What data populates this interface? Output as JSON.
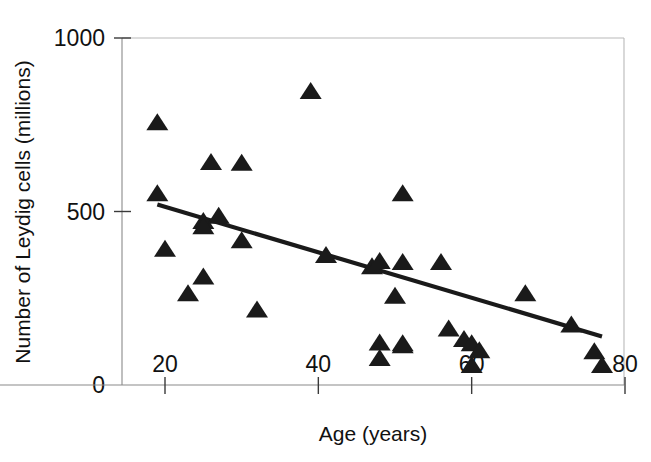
{
  "chart_data": {
    "type": "scatter",
    "title": "",
    "subtitle": "",
    "xlabel": "Age (years)",
    "ylabel": "Number of Leydig cells (millions)",
    "xlim": [
      17,
      80
    ],
    "ylim": [
      -110,
      1000
    ],
    "xticks": [
      20,
      40,
      60,
      80
    ],
    "xtick_labels": [
      "20",
      "40",
      "60",
      "80"
    ],
    "yticks": [
      0,
      500,
      1000
    ],
    "ytick_labels": [
      "0",
      "500",
      "1000"
    ],
    "grid": false,
    "legend": null,
    "legend_position": "none",
    "marker": "triangle",
    "marker_color": "#1a1a1a",
    "frame_color": "#b9b9b9",
    "axis_color": "#8a8a8a",
    "points": [
      {
        "x": 19,
        "y": 755
      },
      {
        "x": 19,
        "y": 550
      },
      {
        "x": 20,
        "y": 390
      },
      {
        "x": 23,
        "y": 262
      },
      {
        "x": 25,
        "y": 470
      },
      {
        "x": 25,
        "y": 455
      },
      {
        "x": 25,
        "y": 310
      },
      {
        "x": 26,
        "y": 640
      },
      {
        "x": 27,
        "y": 485
      },
      {
        "x": 30,
        "y": 638
      },
      {
        "x": 30,
        "y": 415
      },
      {
        "x": 32,
        "y": 215
      },
      {
        "x": 39,
        "y": 845
      },
      {
        "x": 41,
        "y": 372
      },
      {
        "x": 47,
        "y": 340
      },
      {
        "x": 48,
        "y": 355
      },
      {
        "x": 48,
        "y": 120
      },
      {
        "x": 48,
        "y": 75
      },
      {
        "x": 50,
        "y": 255
      },
      {
        "x": 51,
        "y": 550
      },
      {
        "x": 51,
        "y": 352
      },
      {
        "x": 51,
        "y": 118
      },
      {
        "x": 51,
        "y": 112
      },
      {
        "x": 56,
        "y": 352
      },
      {
        "x": 57,
        "y": 160
      },
      {
        "x": 59,
        "y": 130
      },
      {
        "x": 60,
        "y": 118
      },
      {
        "x": 60,
        "y": 55
      },
      {
        "x": 61,
        "y": 98
      },
      {
        "x": 67,
        "y": 262
      },
      {
        "x": 73,
        "y": 172
      },
      {
        "x": 76,
        "y": 95
      },
      {
        "x": 77,
        "y": 55
      }
    ],
    "trendline": {
      "type": "linear-fit",
      "x_start": 19,
      "y_start": 520,
      "x_end": 77,
      "y_end": 140
    }
  }
}
